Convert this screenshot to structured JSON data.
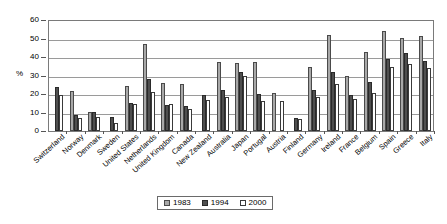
{
  "chart_data": {
    "type": "bar",
    "title": "",
    "xlabel": "",
    "ylabel": "%",
    "ylim": [
      0,
      60
    ],
    "yticks": [
      0,
      10,
      20,
      30,
      40,
      50,
      60
    ],
    "grid": true,
    "legend_position": "bottom-center",
    "categories": [
      "Switzerland",
      "Norway",
      "Denmark",
      "Sweden",
      "United States",
      "Netherlands",
      "United Kingdom",
      "Canada",
      "New Zealand",
      "Australia",
      "Japan",
      "Portugal",
      "Austria",
      "Finland",
      "Germany",
      "Ireland",
      "France",
      "Belgium",
      "Spain",
      "Greece",
      "Italy"
    ],
    "series": [
      {
        "name": "1983",
        "color": "#a8a8a8",
        "values": [
          null,
          21.5,
          10.3,
          null,
          24.1,
          47.0,
          26.0,
          25.5,
          null,
          37.5,
          37.0,
          37.5,
          20.5,
          null,
          34.5,
          52.0,
          30.0,
          42.7,
          54.2,
          50.5,
          51.5
        ]
      },
      {
        "name": "1994",
        "color": "#4f4f4f",
        "values": [
          23.8,
          8.9,
          10.2,
          7.7,
          15.3,
          27.9,
          14.3,
          13.5,
          19.4,
          22.0,
          32.0,
          19.9,
          null,
          6.8,
          22.0,
          32.0,
          19.4,
          26.4,
          38.9,
          42.0,
          38.0
        ]
      },
      {
        "name": "2000",
        "color": "#ffffff",
        "values": [
          19.6,
          6.9,
          7.8,
          4.2,
          14.8,
          21.0,
          14.4,
          11.7,
          16.9,
          18.4,
          30.0,
          16.4,
          16.3,
          6.5,
          18.5,
          25.4,
          17.4,
          20.5,
          34.5,
          36.0,
          34.0
        ]
      }
    ]
  },
  "legend": {
    "items": [
      {
        "label": "1983",
        "swatch": "legend-swatch-1983"
      },
      {
        "label": "1994",
        "swatch": "legend-swatch-1994"
      },
      {
        "label": "2000",
        "swatch": "legend-swatch-2000"
      }
    ]
  }
}
